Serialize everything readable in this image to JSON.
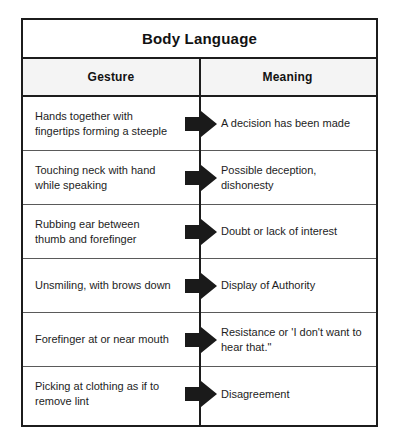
{
  "table": {
    "title": "Body Language",
    "columns": [
      {
        "key": "gesture",
        "label": "Gesture"
      },
      {
        "key": "meaning",
        "label": "Meaning"
      }
    ],
    "connector_icon": "right-block-arrow-icon",
    "rows": [
      {
        "gesture": "Hands together with fingertips forming a steeple",
        "meaning": "A decision has been made"
      },
      {
        "gesture": "Touching neck with hand while speaking",
        "meaning": "Possible deception, dishonesty"
      },
      {
        "gesture": "Rubbing ear between thumb and forefinger",
        "meaning": "Doubt or lack of interest"
      },
      {
        "gesture": "Unsmiling, with brows down",
        "meaning": "Display of Authority"
      },
      {
        "gesture": "Forefinger at or near mouth",
        "meaning": "Resistance or 'I don't want to hear that.\""
      },
      {
        "gesture": "Picking at clothing as if to remove lint",
        "meaning": "Disagreement"
      }
    ]
  },
  "colors": {
    "border": "#1c1c1c",
    "row_divider": "#5a5a5a",
    "header_background": "#f4f4f4",
    "page_background": "#ffffff",
    "text": "#1d1d1d",
    "arrow_fill": "#1a1a1a"
  }
}
